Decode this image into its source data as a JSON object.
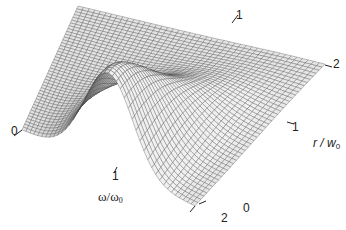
{
  "chart_data": {
    "type": "surface3d",
    "title": "",
    "x_axis": {
      "label": "ω/ω",
      "label_sub": "0",
      "ticks": [
        "0",
        "1",
        "2"
      ],
      "range": [
        0,
        2
      ]
    },
    "y_axis": {
      "label": "r / w",
      "label_sub": "0",
      "ticks": [
        "0",
        "1",
        "2"
      ],
      "range": [
        0,
        2
      ]
    },
    "z_axis": {
      "label": "",
      "ticks": []
    },
    "grid": "mesh",
    "colors": {
      "surface_light": "#e6e6e6",
      "surface_dark": "#9a9a9a",
      "mesh": "#4a4a4a"
    }
  },
  "labels": {
    "left_corner": "0",
    "omega_tick_1": "1",
    "omega_label": "ω/ω",
    "omega_sub": "0",
    "bottom_omega_2": "2",
    "bottom_r_0": "0",
    "r_tick_1": "1",
    "r_label": "r / w",
    "r_sub": "0",
    "top_tick_1": "1",
    "top_tick_2": "2"
  }
}
